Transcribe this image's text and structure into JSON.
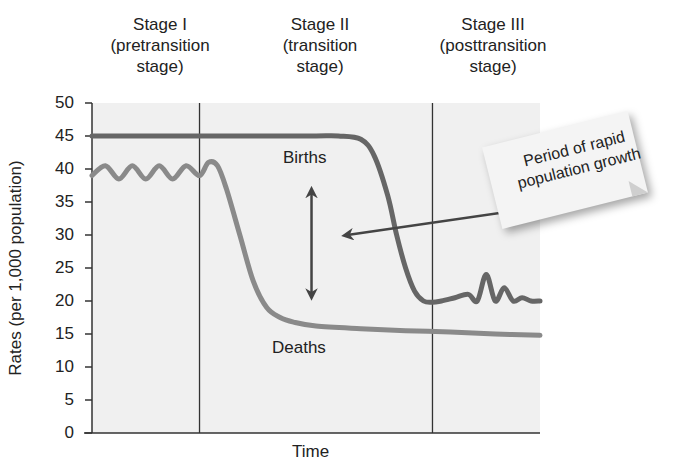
{
  "chart_data": {
    "type": "line",
    "title": "",
    "xlabel": "Time",
    "ylabel": "Rates (per 1,000 population)",
    "ylim": [
      0,
      50
    ],
    "yticks": [
      0,
      5,
      10,
      15,
      20,
      25,
      30,
      35,
      40,
      45,
      50
    ],
    "xlim": [
      0,
      100
    ],
    "grid": false,
    "stages": [
      {
        "name": "Stage I",
        "desc_line1": "(pretransition",
        "desc_line2": "stage)",
        "x_start": 0,
        "x_end": 24
      },
      {
        "name": "Stage II",
        "desc_line1": "(transition",
        "desc_line2": "stage)",
        "x_start": 24,
        "x_end": 76
      },
      {
        "name": "Stage III",
        "desc_line1": "(posttransition",
        "desc_line2": "stage)",
        "x_start": 76,
        "x_end": 100
      }
    ],
    "series": [
      {
        "name": "Births",
        "color": "#666666",
        "x": [
          0,
          10,
          20,
          30,
          40,
          50,
          55,
          60,
          63,
          66,
          68,
          70,
          72,
          74,
          76,
          78,
          81,
          84,
          86,
          88,
          90,
          92,
          94,
          96,
          98,
          100
        ],
        "values": [
          45,
          45,
          45,
          45,
          45,
          45,
          45,
          44.5,
          42,
          36,
          30,
          25,
          21.5,
          20,
          19.8,
          20,
          20.5,
          21,
          20,
          24,
          20,
          22,
          20,
          20.5,
          20,
          20
        ]
      },
      {
        "name": "Deaths",
        "color": "#8a8a8a",
        "x": [
          0,
          3,
          6,
          9,
          12,
          15,
          18,
          21,
          24,
          26,
          28,
          30,
          33,
          36,
          39,
          42,
          45,
          50,
          60,
          70,
          80,
          90,
          100
        ],
        "values": [
          39,
          40.5,
          38.5,
          40.5,
          38.5,
          40.5,
          38.5,
          40.5,
          39,
          41,
          40.5,
          37,
          30,
          23,
          19,
          17.5,
          16.8,
          16.2,
          15.8,
          15.5,
          15.3,
          15,
          14.8
        ]
      }
    ],
    "annotations": [
      {
        "text": "Births",
        "x": 50,
        "y": 41
      },
      {
        "text": "Deaths",
        "x": 50,
        "y": 11.5
      },
      {
        "text": "Period of rapid population growth",
        "type": "callout-note",
        "arrow_to": {
          "x": 57,
          "y": 30
        }
      },
      {
        "type": "double-arrow",
        "x": 49,
        "y_from": 36.5,
        "y_to": 21
      }
    ]
  },
  "ui": {
    "stage1": {
      "line1": "Stage I",
      "line2": "(pretransition",
      "line3": "stage)"
    },
    "stage2": {
      "line1": "Stage II",
      "line2": "(transition",
      "line3": "stage)"
    },
    "stage3": {
      "line1": "Stage III",
      "line2": "(posttransition",
      "line3": "stage)"
    },
    "ylabel": "Rates (per 1,000 population)",
    "xlabel": "Time",
    "births_label": "Births",
    "deaths_label": "Deaths",
    "note_line1": "Period of rapid",
    "note_line2": "population growth",
    "yticks": [
      "50",
      "45",
      "40",
      "35",
      "30",
      "25",
      "20",
      "15",
      "10",
      "5",
      "0"
    ]
  }
}
